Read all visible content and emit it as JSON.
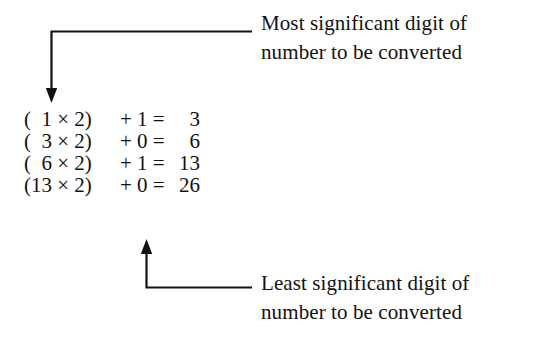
{
  "figure": {
    "background_color": "#ffffff",
    "ink_color": "#121212"
  },
  "annotations": {
    "top": {
      "line1": "Most significant digit of",
      "line2": "number to be converted",
      "pointer": "down-arrow-to-first-equation"
    },
    "bottom": {
      "line1": "Least significant digit of",
      "line2": "number to be converted",
      "pointer": "up-arrow-to-last-equation-digit"
    }
  },
  "equations": {
    "rows": [
      {
        "lhs": "(  1 × 2)",
        "mid": "+ 1 =",
        "rhs": "3"
      },
      {
        "lhs": "(  3 × 2)",
        "mid": "+ 0 =",
        "rhs": "6"
      },
      {
        "lhs": "(  6 × 2)",
        "mid": "+ 1 =",
        "rhs": "13"
      },
      {
        "lhs": "(13 × 2)",
        "mid": "+ 0 =",
        "rhs": "26"
      }
    ]
  }
}
